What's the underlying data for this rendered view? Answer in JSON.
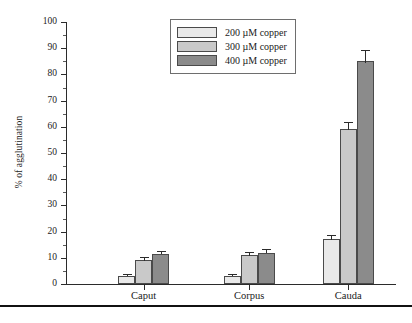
{
  "chart_data": {
    "type": "bar",
    "title": "",
    "xlabel": "",
    "ylabel": "% of agglutination",
    "ylim": [
      0,
      100
    ],
    "ytick_step": 10,
    "yminor_step": 5,
    "grid": false,
    "legend_position": "top-center",
    "categories": [
      "Caput",
      "Corpus",
      "Cauda"
    ],
    "ytick_labels": [
      "0",
      "10",
      "20",
      "30",
      "40",
      "50",
      "60",
      "70",
      "80",
      "90",
      "100"
    ],
    "series": [
      {
        "name": "200 µM copper",
        "color": "#e9e9e9",
        "values": [
          3,
          3,
          17
        ],
        "errors": [
          0.5,
          0.5,
          1.5
        ]
      },
      {
        "name": "300 µM copper",
        "color": "#c9c9c9",
        "values": [
          9,
          11,
          59
        ],
        "errors": [
          0.8,
          0.8,
          2.5
        ]
      },
      {
        "name": "400 µM copper",
        "color": "#8b8b8b",
        "values": [
          11.5,
          12,
          85
        ],
        "errors": [
          0.8,
          0.8,
          4
        ]
      }
    ]
  }
}
